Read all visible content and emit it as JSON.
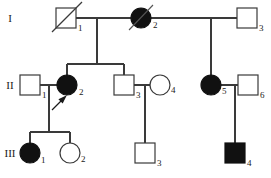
{
  "figure": {
    "type": "pedigree-chart",
    "title": "",
    "caption": "",
    "width": 271,
    "height": 178,
    "background_color": "#ffffff",
    "line_color": "#3a3a3a",
    "affected_fill": "#111111",
    "unaffected_fill": "#ffffff"
  },
  "legend_semantics": {
    "square": "male",
    "circle": "female",
    "filled": "affected",
    "open": "unaffected",
    "diagonal_slash": "deceased",
    "arrow": "proband"
  },
  "generations": [
    {
      "label": "I",
      "y": 18
    },
    {
      "label": "II",
      "y": 85
    },
    {
      "label": "III",
      "y": 153
    }
  ],
  "individuals": [
    {
      "id": "I-1",
      "number": "1",
      "generation": "I",
      "sex": "male",
      "shape": "square",
      "affected": false,
      "deceased": true,
      "proband": false,
      "x": 66,
      "y": 18
    },
    {
      "id": "I-2",
      "number": "2",
      "generation": "I",
      "sex": "female",
      "shape": "circle",
      "affected": true,
      "deceased": true,
      "proband": false,
      "x": 141,
      "y": 18
    },
    {
      "id": "I-3",
      "number": "3",
      "generation": "I",
      "sex": "male",
      "shape": "square",
      "affected": false,
      "deceased": false,
      "proband": false,
      "x": 247,
      "y": 18
    },
    {
      "id": "II-1",
      "number": "1",
      "generation": "II",
      "sex": "male",
      "shape": "square",
      "affected": false,
      "deceased": false,
      "proband": false,
      "x": 30,
      "y": 85
    },
    {
      "id": "II-2",
      "number": "2",
      "generation": "II",
      "sex": "female",
      "shape": "circle",
      "affected": true,
      "deceased": false,
      "proband": true,
      "x": 67,
      "y": 85
    },
    {
      "id": "II-3",
      "number": "3",
      "generation": "II",
      "sex": "male",
      "shape": "square",
      "affected": false,
      "deceased": false,
      "proband": false,
      "x": 124,
      "y": 85
    },
    {
      "id": "II-4",
      "number": "4",
      "generation": "II",
      "sex": "female",
      "shape": "circle",
      "affected": false,
      "deceased": false,
      "proband": false,
      "x": 160,
      "y": 85
    },
    {
      "id": "II-5",
      "number": "5",
      "generation": "II",
      "sex": "female",
      "shape": "circle",
      "affected": true,
      "deceased": false,
      "proband": false,
      "x": 211,
      "y": 85
    },
    {
      "id": "II-6",
      "number": "6",
      "generation": "II",
      "sex": "male",
      "shape": "square",
      "affected": false,
      "deceased": false,
      "proband": false,
      "x": 248,
      "y": 85
    },
    {
      "id": "III-1",
      "number": "1",
      "generation": "III",
      "sex": "female",
      "shape": "circle",
      "affected": true,
      "deceased": false,
      "proband": false,
      "x": 30,
      "y": 153
    },
    {
      "id": "III-2",
      "number": "2",
      "generation": "III",
      "sex": "female",
      "shape": "circle",
      "affected": false,
      "deceased": false,
      "proband": false,
      "x": 70,
      "y": 153
    },
    {
      "id": "III-3",
      "number": "3",
      "generation": "III",
      "sex": "male",
      "shape": "square",
      "affected": false,
      "deceased": false,
      "proband": false,
      "x": 145,
      "y": 153
    },
    {
      "id": "III-4",
      "number": "4",
      "generation": "III",
      "sex": "male",
      "shape": "square",
      "affected": true,
      "deceased": false,
      "proband": false,
      "x": 235,
      "y": 153
    }
  ],
  "matings": [
    {
      "partners": [
        "I-1",
        "I-2"
      ],
      "children": [
        "II-2",
        "II-3"
      ]
    },
    {
      "partners": [
        "I-2",
        "I-3"
      ],
      "children": [
        "II-5"
      ]
    },
    {
      "partners": [
        "II-1",
        "II-2"
      ],
      "children": [
        "III-1",
        "III-2"
      ]
    },
    {
      "partners": [
        "II-3",
        "II-4"
      ],
      "children": [
        "III-3"
      ]
    },
    {
      "partners": [
        "II-5",
        "II-6"
      ],
      "children": [
        "III-4"
      ]
    }
  ]
}
